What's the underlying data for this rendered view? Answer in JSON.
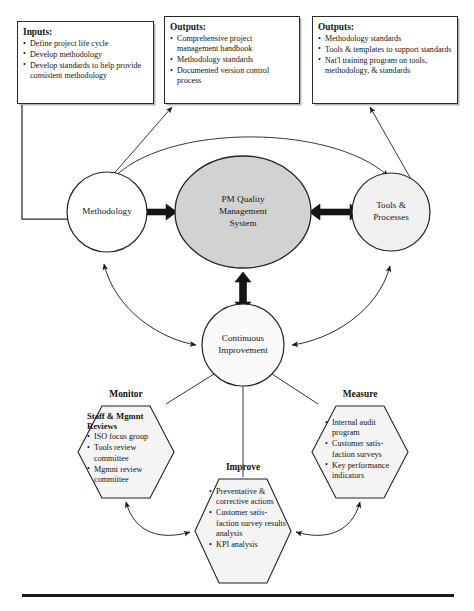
{
  "diagram": {
    "title": "PM Quality Management System",
    "colors": {
      "center_fill": "#d2d2d2",
      "side_fill": "#f0f0f0",
      "hex_fill": "#f4f4f4",
      "stroke": "#2b2b2b",
      "thick_arrow": "#151515",
      "text": "#141414"
    },
    "boxes": [
      {
        "id": "inputs",
        "title": "Inputs:",
        "items": [
          "Define project life cycle",
          "Develop methodology",
          "Develop standards to help provide consistent methodology"
        ]
      },
      {
        "id": "outputs-methodology",
        "title": "Outputs:",
        "items": [
          "Comprehensive project management handbook",
          "Methodology standards",
          "Documented version control process"
        ]
      },
      {
        "id": "outputs-tools",
        "title": "Outputs:",
        "items": [
          "Methodology standards",
          "Tools & templates to support standards",
          "Nat'l training program on tools, methodology, & standards"
        ]
      }
    ],
    "nodes": {
      "methodology": "Methodology",
      "center_line1": "PM Quality",
      "center_line2": "Management",
      "center_line3": "System",
      "tools_line1": "Tools &",
      "tools_line2": "Processes",
      "improvement_line1": "Continuous",
      "improvement_line2": "Improvement"
    },
    "hexagons": [
      {
        "id": "monitor",
        "heading": "Monitor",
        "inner_title": "Staff & Mgmnt Reviews",
        "items": [
          "ISO focus group",
          "Tools review committee",
          "Mgmnt review committee"
        ]
      },
      {
        "id": "measure",
        "heading": "Measure",
        "inner_title": "",
        "items": [
          "Internal audit program",
          "Customer satis- faction surveys",
          "Key performance indicators"
        ]
      },
      {
        "id": "improve",
        "heading": "Improve",
        "inner_title": "",
        "items": [
          "Preventative & corrective actions",
          "Customer satis- faction survey results analysis",
          "KPI analysis"
        ]
      }
    ]
  }
}
